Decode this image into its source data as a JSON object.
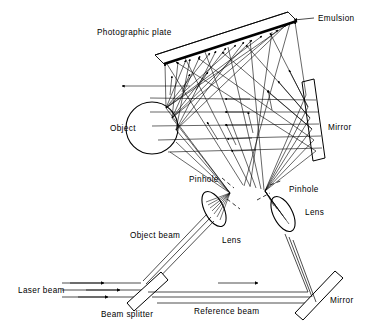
{
  "diagram": {
    "title_present": false,
    "type": "optical-holography-setup",
    "background_color": "#ffffff",
    "line_color": "#000000",
    "labels": {
      "photographic_plate": "Photographic plate",
      "emulsion": "Emulsion",
      "object": "Object",
      "mirror_top": "Mirror",
      "pinhole_left": "Pinhole",
      "pinhole_right": "Pinhole",
      "lens_left": "Lens",
      "lens_right": "Lens",
      "object_beam": "Object beam",
      "laser_beam": "Laser beam",
      "beam_splitter": "Beam splitter",
      "reference_beam": "Reference beam",
      "mirror_bottom": "Mirror"
    },
    "components": [
      {
        "name": "photographic-plate",
        "shape": "tilted-thin-plate",
        "note": "emulsion side drawn as thick black edge"
      },
      {
        "name": "emulsion",
        "shape": "thick-line",
        "note": "lower-right face of the photographic plate"
      },
      {
        "name": "object",
        "shape": "circle",
        "cx": 152,
        "cy": 128,
        "r": 26
      },
      {
        "name": "mirror-top",
        "shape": "tilted-rectangle"
      },
      {
        "name": "lens-left",
        "shape": "ellipse-lens"
      },
      {
        "name": "lens-right",
        "shape": "ellipse-lens"
      },
      {
        "name": "pinhole-left",
        "shape": "dashed-gap-marker"
      },
      {
        "name": "pinhole-right",
        "shape": "dashed-gap-marker"
      },
      {
        "name": "beam-splitter",
        "shape": "tilted-rectangle"
      },
      {
        "name": "mirror-bottom",
        "shape": "tilted-rectangle"
      }
    ],
    "beams": [
      {
        "name": "laser-beam",
        "style": "three-parallel-rays-with-arrowheads",
        "direction": "left-to-right"
      },
      {
        "name": "object-beam",
        "style": "three-parallel-rays",
        "direction": "up-right toward left lens"
      },
      {
        "name": "reference-beam",
        "style": "three-parallel-rays-with-arrowhead",
        "direction": "left-to-right toward bottom mirror"
      },
      {
        "name": "object-illumination-cone",
        "style": "diverging-rays-from-left-pinhole"
      },
      {
        "name": "scattered-object-rays",
        "style": "rays-from-object-to-plate-with-arrowheads"
      },
      {
        "name": "reference-cone",
        "style": "diverging-rays-from-right-pinhole-to-top-mirror"
      },
      {
        "name": "reference-reflected-rays",
        "style": "rays-from-top-mirror-to-plate-with-arrowheads"
      }
    ]
  }
}
